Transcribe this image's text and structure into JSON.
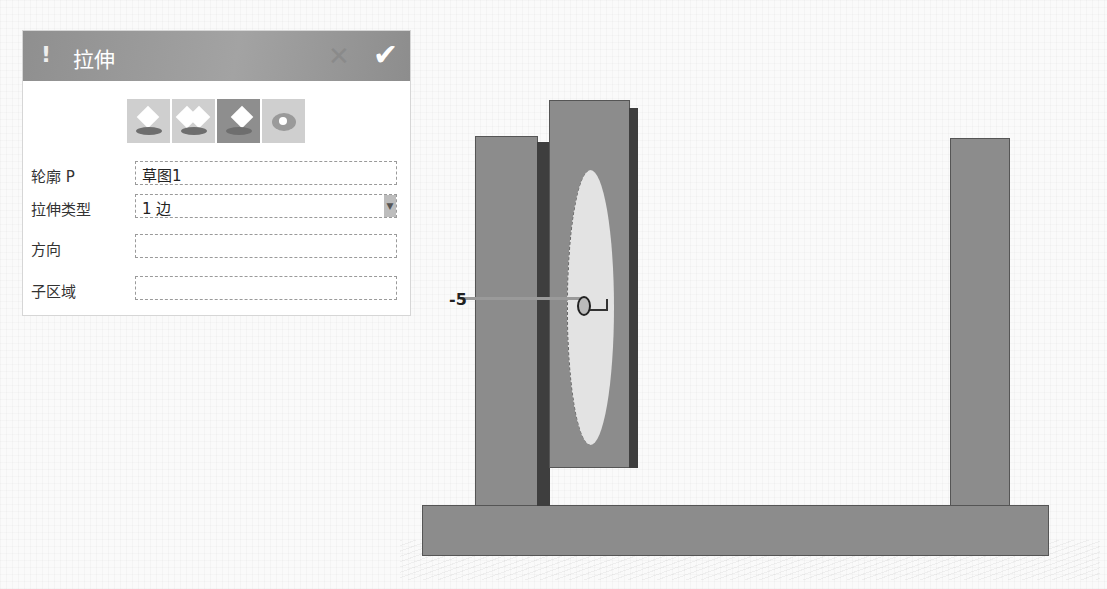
{
  "dialog": {
    "title": "拉伸",
    "warning_icon": "!",
    "close_icon": "✕",
    "ok_icon": "✔",
    "mode_icons": [
      {
        "name": "extrude-one-side-icon",
        "selected": false
      },
      {
        "name": "extrude-two-sides-icon",
        "selected": false
      },
      {
        "name": "extrude-asymmetric-icon",
        "selected": true
      },
      {
        "name": "extrude-revolve-icon",
        "selected": false
      }
    ],
    "fields": [
      {
        "label": "轮廓 P",
        "value": "草图1",
        "type": "text"
      },
      {
        "label": "拉伸类型",
        "value": "1 边",
        "type": "dropdown"
      },
      {
        "label": "方向",
        "value": "",
        "type": "text"
      },
      {
        "label": "子区域",
        "value": "",
        "type": "text"
      }
    ]
  },
  "viewport": {
    "dimension_start": "-5",
    "dimension_end": "0"
  },
  "colors": {
    "header": "#9a9a9a",
    "solid_face": "#8c8c8c",
    "solid_side": "#3e3e3e",
    "sketch_profile": "#e3e3e3"
  }
}
